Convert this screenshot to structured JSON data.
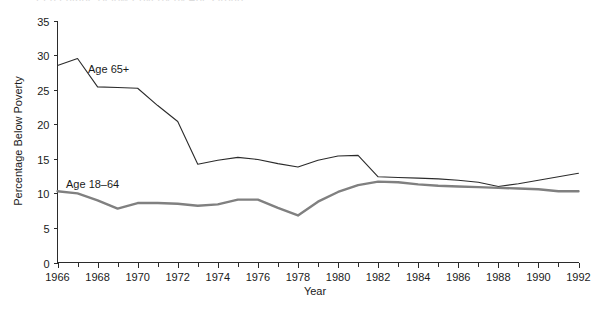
{
  "figure": {
    "clipped_title_fragment": "Percentage Below Poverty by Age Group",
    "y_axis_title": "Percentage Below Poverty",
    "x_axis_title": "Year",
    "series_label_old": "Age 65+",
    "series_label_young": "Age 18–64"
  },
  "chart_data": {
    "type": "line",
    "title": "",
    "xlabel": "Year",
    "ylabel": "Percentage Below Poverty",
    "xlim": [
      1966,
      1992
    ],
    "ylim": [
      0,
      35
    ],
    "grid": false,
    "legend": "inline-labels",
    "x_tick_labels": [
      "1966",
      "1968",
      "1970",
      "1972",
      "1974",
      "1976",
      "1978",
      "1980",
      "1982",
      "1984",
      "1986",
      "1988",
      "1990",
      "1992"
    ],
    "x_tick_values": [
      1966,
      1968,
      1970,
      1972,
      1974,
      1976,
      1978,
      1980,
      1982,
      1984,
      1986,
      1988,
      1990,
      1992
    ],
    "x_minor_tick_interval": 1,
    "y_tick_labels": [
      "0",
      "5",
      "10",
      "15",
      "20",
      "25",
      "30",
      "35"
    ],
    "y_tick_values": [
      0,
      5,
      10,
      15,
      20,
      25,
      30,
      35
    ],
    "x": [
      1966,
      1967,
      1968,
      1969,
      1970,
      1971,
      1972,
      1973,
      1974,
      1975,
      1976,
      1977,
      1978,
      1979,
      1980,
      1981,
      1982,
      1983,
      1984,
      1985,
      1986,
      1987,
      1988,
      1989,
      1990,
      1991,
      1992
    ],
    "series": [
      {
        "name": "Age 65+",
        "color": "#2b2b2b",
        "line_width": 1.1,
        "values": [
          28.5,
          29.5,
          25.4,
          25.3,
          25.2,
          22.7,
          20.4,
          14.2,
          14.8,
          15.2,
          14.9,
          14.3,
          13.8,
          14.8,
          15.4,
          15.5,
          12.4,
          12.3,
          12.2,
          12.1,
          11.9,
          11.6,
          11.0,
          11.4,
          11.9,
          12.4,
          12.9
        ],
        "units": "percent"
      },
      {
        "name": "Age 18–64",
        "color": "#808080",
        "line_width": 2.4,
        "values": [
          10.3,
          10.0,
          9.0,
          7.8,
          8.6,
          8.6,
          8.5,
          8.2,
          8.4,
          9.1,
          9.1,
          7.9,
          6.8,
          8.8,
          10.2,
          11.2,
          11.7,
          11.6,
          11.3,
          11.1,
          11.0,
          10.9,
          10.8,
          10.7,
          10.6,
          10.3,
          10.3
        ],
        "units": "percent"
      }
    ]
  }
}
